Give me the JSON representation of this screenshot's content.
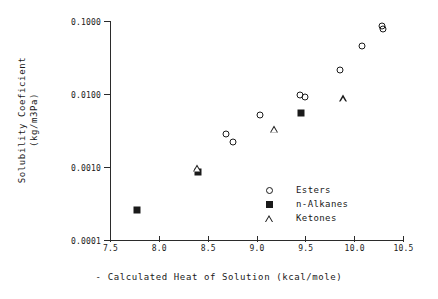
{
  "chart_data": {
    "type": "scatter",
    "title": "",
    "xlabel": "- Calculated Heat of Solution (kcal/mole)",
    "ylabel_line1": "Solubility Coeficient",
    "ylabel_line2": "(kg/m3Pa)",
    "xlim": [
      7.5,
      10.5
    ],
    "ylim": [
      0.0001,
      0.1
    ],
    "yscale": "log",
    "grid": false,
    "legend_position": "lower-right-inside",
    "xticks": [
      "7.5",
      "8.0",
      "8.5",
      "9.0",
      "9.5",
      "10.0",
      "10.5"
    ],
    "xtick_values": [
      7.5,
      8.0,
      8.5,
      9.0,
      9.5,
      10.0,
      10.5
    ],
    "yticks": [
      "0.1000",
      "0.0100",
      "0.0010",
      "0.0001"
    ],
    "ytick_values": [
      0.1,
      0.01,
      0.001,
      0.0001
    ],
    "series": [
      {
        "name": "Esters",
        "marker": "open-circle",
        "color": "#1a1a1a",
        "points": [
          {
            "x": 8.69,
            "y": 0.0028
          },
          {
            "x": 8.76,
            "y": 0.0022
          },
          {
            "x": 9.04,
            "y": 0.0052
          },
          {
            "x": 9.45,
            "y": 0.0097
          },
          {
            "x": 9.5,
            "y": 0.0091
          },
          {
            "x": 9.86,
            "y": 0.021
          },
          {
            "x": 10.08,
            "y": 0.045
          },
          {
            "x": 10.29,
            "y": 0.086
          },
          {
            "x": 10.3,
            "y": 0.078
          }
        ]
      },
      {
        "name": "n-Alkanes",
        "marker": "filled-square",
        "color": "#1a1a1a",
        "points": [
          {
            "x": 7.78,
            "y": 0.00026
          },
          {
            "x": 8.4,
            "y": 0.00086
          },
          {
            "x": 9.46,
            "y": 0.0055
          }
        ]
      },
      {
        "name": "Ketones",
        "marker": "open-triangle",
        "color": "#1a1a1a",
        "points": [
          {
            "x": 8.39,
            "y": 0.00098
          },
          {
            "x": 9.18,
            "y": 0.0042
          },
          {
            "x": 9.89,
            "y": 0.0135
          }
        ]
      }
    ]
  },
  "legend": {
    "entries": [
      {
        "label": "Esters",
        "marker": "open-circle"
      },
      {
        "label": "n-Alkanes",
        "marker": "filled-square"
      },
      {
        "label": "Ketones",
        "marker": "open-triangle"
      }
    ]
  }
}
